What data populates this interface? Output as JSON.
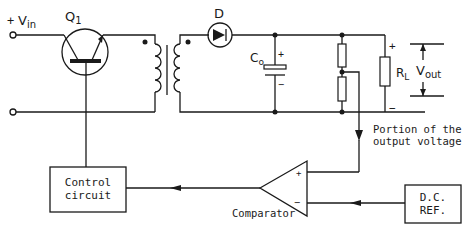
{
  "diagram": {
    "type": "circuit-schematic",
    "colors": {
      "line": "#1a1a1a",
      "background": "#ffffff"
    }
  },
  "labels": {
    "vin_plus": "+",
    "vin": "V",
    "vin_sub": "in",
    "q1": "Q",
    "q1_sub": "1",
    "diode": "D",
    "co": "C",
    "co_sub": "o",
    "co_plus": "+",
    "co_minus": "−",
    "rl": "R",
    "rl_sub": "L",
    "out_plus": "+",
    "out_minus": "−",
    "vout": "V",
    "vout_sub": "out",
    "portion_line1": "Portion of the",
    "portion_line2": "output voltage",
    "control_line1": "Control",
    "control_line2": "circuit",
    "comparator": "Comparator",
    "comp_plus": "+",
    "comp_minus": "−",
    "dcref_line1": "D.C.",
    "dcref_line2": "REF."
  },
  "components": [
    {
      "id": "Q1",
      "kind": "transistor"
    },
    {
      "id": "T1",
      "kind": "transformer"
    },
    {
      "id": "D",
      "kind": "diode"
    },
    {
      "id": "Co",
      "kind": "capacitor"
    },
    {
      "id": "R_div",
      "kind": "voltage-divider"
    },
    {
      "id": "RL",
      "kind": "resistor"
    },
    {
      "id": "control",
      "kind": "block"
    },
    {
      "id": "comparator",
      "kind": "op-amp"
    },
    {
      "id": "dcref",
      "kind": "block"
    }
  ]
}
